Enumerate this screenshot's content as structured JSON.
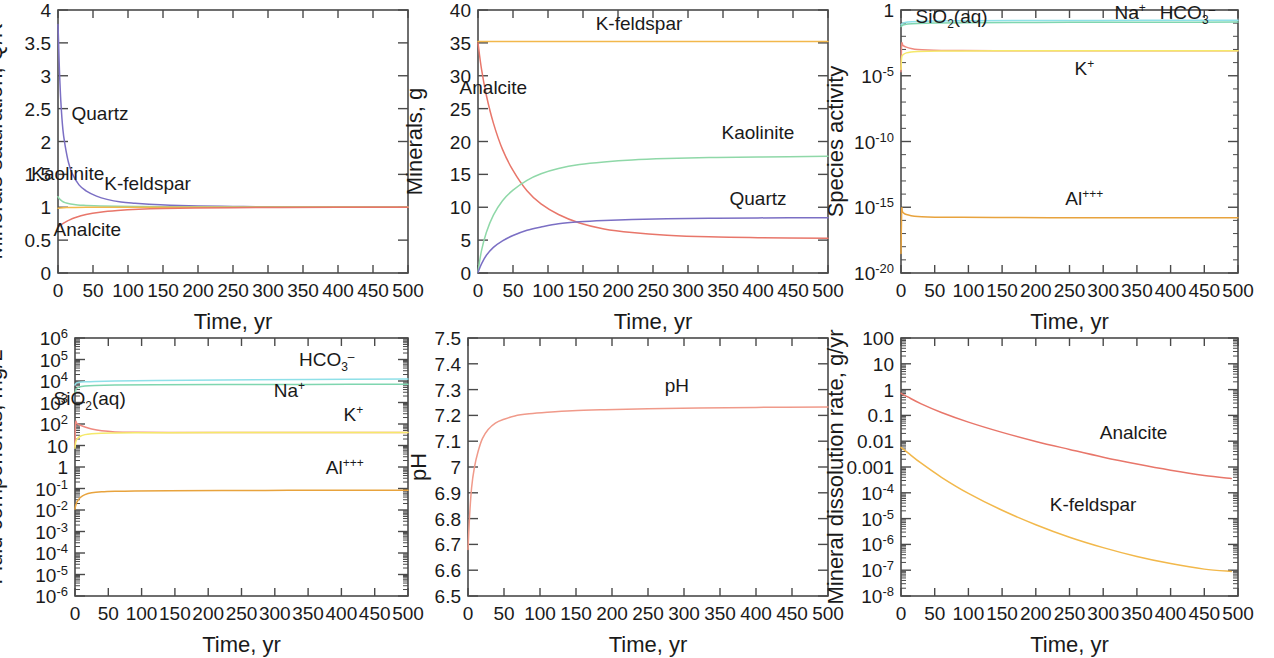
{
  "figure": {
    "title": "",
    "panel_count": 6,
    "layout": "2 rows x 3 columns",
    "colors": {
      "quartz": "#7b6fc4",
      "kaolinite": "#8fd8a8",
      "k_feldspar": "#f2b84b",
      "analcite": "#e8766a",
      "ph": "#f09a8a",
      "na": "#7fd6b0",
      "hco3": "#8fe0e8",
      "k_ion": "#f5e96a",
      "al": "#e8a33d",
      "sio2": "#ef8a80",
      "axis": "#4a4a4a",
      "text": "#1a1a1a"
    },
    "shared_xlabel": "Time, yr",
    "shared_xticks": [
      "0",
      "50",
      "100",
      "150",
      "200",
      "250",
      "300",
      "350",
      "400",
      "450",
      "500"
    ]
  },
  "chart_data": [
    {
      "id": "panel-minerals-saturation",
      "type": "line",
      "title": "",
      "xlabel": "Time, yr",
      "ylabel": "Minerals saturation, Q/K",
      "xlim": [
        0,
        500
      ],
      "ylim": [
        0,
        4
      ],
      "yscale": "linear",
      "xscale": "linear",
      "xticks": [
        "0",
        "50",
        "100",
        "150",
        "200",
        "250",
        "300",
        "350",
        "400",
        "450",
        "500"
      ],
      "yticks": [
        "0",
        "0.5",
        "1",
        "1.5",
        "2",
        "2.5",
        "3",
        "3.5",
        "4"
      ],
      "grid": false,
      "legend": "inline-annotations",
      "series": [
        {
          "name": "Quartz",
          "color": "#7b6fc4",
          "label_x": 60,
          "label_y": 2.32,
          "x": [
            0,
            1,
            2,
            4,
            7,
            10,
            15,
            20,
            30,
            40,
            55,
            70,
            90,
            110,
            130,
            160,
            200,
            250,
            300,
            400,
            500
          ],
          "values": [
            3.78,
            3.45,
            3.1,
            2.62,
            2.18,
            1.95,
            1.68,
            1.52,
            1.34,
            1.25,
            1.17,
            1.12,
            1.08,
            1.06,
            1.045,
            1.03,
            1.02,
            1.012,
            1.008,
            1.004,
            1.002
          ]
        },
        {
          "name": "Kaolinite",
          "color": "#8fd8a8",
          "label_x": 14,
          "label_y": 1.42,
          "x": [
            0,
            2,
            5,
            10,
            18,
            28,
            40,
            60,
            85,
            115,
            150,
            200,
            260,
            330,
            420,
            500
          ],
          "values": [
            1.16,
            1.13,
            1.1,
            1.07,
            1.05,
            1.035,
            1.028,
            1.02,
            1.015,
            1.012,
            1.009,
            1.006,
            1.004,
            1.003,
            1.002,
            1.001
          ]
        },
        {
          "name": "K-feldspar",
          "color": "#f2b84b",
          "label_x": 128,
          "label_y": 1.26,
          "x": [
            0,
            3,
            8,
            15,
            25,
            40,
            60,
            90,
            130,
            180,
            250,
            330,
            420,
            500
          ],
          "values": [
            0.985,
            0.99,
            0.994,
            0.996,
            0.998,
            0.999,
            1.0,
            1.0,
            1.0,
            1.0,
            1.0,
            1.0,
            1.0,
            1.0
          ]
        },
        {
          "name": "Analcite",
          "color": "#e8766a",
          "label_x": 42,
          "label_y": 0.56,
          "x": [
            0,
            3,
            8,
            15,
            25,
            40,
            60,
            85,
            115,
            150,
            195,
            250,
            320,
            400,
            500
          ],
          "values": [
            0.7,
            0.725,
            0.76,
            0.8,
            0.845,
            0.89,
            0.925,
            0.95,
            0.968,
            0.98,
            0.988,
            0.993,
            0.997,
            0.999,
            1.0
          ]
        }
      ]
    },
    {
      "id": "panel-minerals-mass",
      "type": "line",
      "title": "",
      "xlabel": "Time, yr",
      "ylabel": "Minerals, g",
      "xlim": [
        0,
        500
      ],
      "ylim": [
        0,
        40
      ],
      "yscale": "linear",
      "xscale": "linear",
      "xticks": [
        "0",
        "50",
        "100",
        "150",
        "200",
        "250",
        "300",
        "350",
        "400",
        "450",
        "500"
      ],
      "yticks": [
        "0",
        "5",
        "10",
        "15",
        "20",
        "25",
        "30",
        "35",
        "40"
      ],
      "grid": false,
      "legend": "inline-annotations",
      "series": [
        {
          "name": "K-feldspar",
          "color": "#f2b84b",
          "label_x": 230,
          "label_y": 37.0,
          "x": [
            0,
            50,
            100,
            200,
            300,
            400,
            500
          ],
          "values": [
            35.2,
            35.2,
            35.2,
            35.2,
            35.2,
            35.2,
            35.2
          ]
        },
        {
          "name": "Analcite",
          "color": "#e8766a",
          "label_x": 22,
          "label_y": 27.2,
          "x": [
            0,
            5,
            12,
            22,
            35,
            50,
            70,
            90,
            115,
            145,
            180,
            220,
            270,
            330,
            400,
            500
          ],
          "values": [
            35.0,
            31.0,
            27.0,
            22.8,
            18.8,
            15.6,
            12.5,
            10.5,
            8.9,
            7.6,
            6.7,
            6.15,
            5.75,
            5.5,
            5.38,
            5.3
          ]
        },
        {
          "name": "Kaolinite",
          "color": "#8fd8a8",
          "label_x": 400,
          "label_y": 20.4,
          "x": [
            0,
            5,
            12,
            22,
            35,
            50,
            70,
            90,
            115,
            145,
            180,
            220,
            270,
            330,
            400,
            500
          ],
          "values": [
            0.2,
            3.4,
            6.2,
            8.8,
            11.0,
            12.6,
            14.1,
            15.1,
            15.9,
            16.5,
            16.9,
            17.2,
            17.4,
            17.55,
            17.65,
            17.75
          ]
        },
        {
          "name": "Quartz",
          "color": "#7b6fc4",
          "label_x": 400,
          "label_y": 10.4,
          "x": [
            0,
            5,
            12,
            22,
            35,
            50,
            70,
            90,
            115,
            145,
            180,
            220,
            270,
            330,
            400,
            500
          ],
          "values": [
            0.1,
            1.4,
            2.7,
            3.9,
            4.9,
            5.7,
            6.5,
            7.0,
            7.5,
            7.8,
            8.0,
            8.15,
            8.25,
            8.32,
            8.38,
            8.42
          ]
        }
      ]
    },
    {
      "id": "panel-species-activity",
      "type": "line",
      "title": "",
      "xlabel": "Time, yr",
      "ylabel": "Species activity",
      "xlim": [
        0,
        500
      ],
      "ylim": [
        1e-20,
        1
      ],
      "yscale": "log",
      "xscale": "linear",
      "xticks": [
        "0",
        "50",
        "100",
        "150",
        "200",
        "250",
        "300",
        "350",
        "400",
        "450",
        "500"
      ],
      "yticks": [
        "10⁻²⁰",
        "10⁻¹⁵",
        "10⁻¹⁰",
        "10⁻⁵",
        "1"
      ],
      "ytick_exponents": [
        -20,
        -15,
        -10,
        -5,
        0
      ],
      "grid": false,
      "legend": "inline-annotations",
      "series": [
        {
          "name": "HCO3-",
          "color": "#8fe0e8",
          "label_x": 425,
          "label_y": 0.19,
          "x": [
            0,
            3,
            10,
            25,
            50,
            100,
            200,
            300,
            400,
            500
          ],
          "values": [
            0.075,
            0.1,
            0.12,
            0.135,
            0.145,
            0.152,
            0.158,
            0.162,
            0.165,
            0.168
          ]
        },
        {
          "name": "Na+",
          "color": "#7fd6b0",
          "label_x": 340,
          "label_y": 0.19,
          "x": [
            0,
            3,
            10,
            25,
            50,
            100,
            200,
            300,
            400,
            500
          ],
          "values": [
            0.055,
            0.072,
            0.085,
            0.095,
            0.102,
            0.108,
            0.113,
            0.116,
            0.118,
            0.12
          ]
        },
        {
          "name": "SiO2(aq)",
          "color": "#ef8a80",
          "label_x": 75,
          "label_y": 0.1,
          "x": [
            0,
            1,
            3,
            8,
            15,
            25,
            40,
            60,
            90,
            140,
            220,
            320,
            420,
            500
          ],
          "values": [
            2e-05,
            0.0025,
            0.002,
            0.0015,
            0.0012,
            0.001,
            0.0009,
            0.00085,
            0.00082,
            0.0008,
            0.0008,
            0.0008,
            0.0008,
            0.0008
          ]
        },
        {
          "name": "K+",
          "color": "#f5e96a",
          "label_x": 272,
          "label_y": 1.2e-05,
          "x": [
            0,
            1,
            3,
            8,
            15,
            25,
            40,
            60,
            90,
            140,
            220,
            320,
            420,
            500
          ],
          "values": [
            3e-05,
            0.00025,
            0.0004,
            0.00055,
            0.00065,
            0.0007,
            0.00073,
            0.00075,
            0.00077,
            0.00078,
            0.00079,
            0.0008,
            0.0008,
            0.0008
          ]
        },
        {
          "name": "Al+++",
          "color": "#e8a33d",
          "label_x": 272,
          "label_y": 1.6e-15,
          "x": [
            0,
            1,
            2,
            4,
            8,
            15,
            25,
            40,
            60,
            90,
            140,
            220,
            320,
            420,
            500
          ],
          "values": [
            3e-19,
            5.5e-16,
            4.8e-16,
            3.6e-16,
            2.8e-16,
            2.3e-16,
            2e-16,
            1.85e-16,
            1.75e-16,
            1.7e-16,
            1.65e-16,
            1.62e-16,
            1.6e-16,
            1.58e-16,
            1.57e-16
          ]
        }
      ]
    },
    {
      "id": "panel-fluid-components",
      "type": "line",
      "title": "",
      "xlabel": "Time, yr",
      "ylabel": "Fluid components, mg/L",
      "xlim": [
        0,
        500
      ],
      "ylim": [
        1e-06,
        1000000.0
      ],
      "yscale": "log",
      "xscale": "linear",
      "xticks": [
        "0",
        "50",
        "100",
        "150",
        "200",
        "250",
        "300",
        "350",
        "400",
        "450",
        "500"
      ],
      "yticks": [
        "10⁻⁶",
        "10⁻⁵",
        "10⁻⁴",
        "10⁻³",
        "10⁻²",
        "10⁻¹",
        "1",
        "10",
        "10²",
        "10³",
        "10⁴",
        "10⁵",
        "10⁶"
      ],
      "ytick_exponents": [
        -6,
        -5,
        -4,
        -3,
        -2,
        -1,
        0,
        1,
        2,
        3,
        4,
        5,
        6
      ],
      "grid": false,
      "legend": "inline-annotations",
      "series": [
        {
          "name": "HCO3-",
          "color": "#8fe0e8",
          "label_x": 378,
          "label_y": 52000,
          "x": [
            0,
            2,
            6,
            15,
            30,
            60,
            120,
            220,
            350,
            500
          ],
          "values": [
            6500,
            8000,
            8700,
            9200,
            9600,
            10000,
            10600,
            11200,
            11800,
            12400
          ]
        },
        {
          "name": "Na+",
          "color": "#7fd6b0",
          "label_x": 322,
          "label_y": 1750,
          "x": [
            0,
            2,
            6,
            15,
            30,
            60,
            120,
            220,
            350,
            500
          ],
          "values": [
            2800,
            4300,
            5200,
            5800,
            6200,
            6500,
            6700,
            6850,
            6950,
            7050
          ]
        },
        {
          "name": "SiO2(aq)",
          "color": "#ef8a80",
          "label_x": 22,
          "label_y": 760,
          "x": [
            0,
            1,
            3,
            8,
            15,
            25,
            40,
            60,
            90,
            140,
            220,
            320,
            420,
            500
          ],
          "values": [
            9.0,
            115,
            105,
            88,
            72,
            58,
            48,
            43,
            41,
            40,
            40,
            40,
            40,
            40
          ]
        },
        {
          "name": "K+",
          "color": "#f5e96a",
          "label_x": 418,
          "label_y": 145,
          "x": [
            0,
            1,
            3,
            8,
            15,
            25,
            40,
            60,
            90,
            140,
            220,
            320,
            420,
            500
          ],
          "values": [
            7.5,
            14,
            20,
            27,
            32,
            35,
            37,
            38,
            39,
            39.5,
            40,
            40,
            40,
            40
          ]
        },
        {
          "name": "Al+++",
          "color": "#e8a33d",
          "label_x": 405,
          "label_y": 0.45,
          "x": [
            0,
            1,
            3,
            8,
            15,
            25,
            40,
            60,
            90,
            140,
            220,
            320,
            420,
            500
          ],
          "values": [
            0.011,
            0.016,
            0.024,
            0.038,
            0.052,
            0.063,
            0.07,
            0.074,
            0.077,
            0.079,
            0.081,
            0.082,
            0.083,
            0.084
          ]
        }
      ]
    },
    {
      "id": "panel-ph",
      "type": "line",
      "title": "",
      "xlabel": "Time, yr",
      "ylabel": "pH",
      "xlim": [
        0,
        500
      ],
      "ylim": [
        6.5,
        7.5
      ],
      "yscale": "linear",
      "xscale": "linear",
      "xticks": [
        "0",
        "50",
        "100",
        "150",
        "200",
        "250",
        "300",
        "350",
        "400",
        "450",
        "500"
      ],
      "yticks": [
        "6.5",
        "6.6",
        "6.7",
        "6.8",
        "6.9",
        "7",
        "7.1",
        "7.2",
        "7.3",
        "7.4",
        "7.5"
      ],
      "grid": false,
      "legend": "inline-annotations",
      "series": [
        {
          "name": "pH",
          "color": "#f09a8a",
          "label_x": 290,
          "label_y": 7.29,
          "x": [
            0,
            2,
            5,
            9,
            14,
            20,
            28,
            38,
            50,
            65,
            85,
            110,
            145,
            190,
            250,
            320,
            400,
            500
          ],
          "values": [
            6.68,
            6.8,
            6.92,
            7.0,
            7.06,
            7.11,
            7.145,
            7.17,
            7.185,
            7.198,
            7.206,
            7.212,
            7.218,
            7.222,
            7.226,
            7.229,
            7.231,
            7.233
          ]
        }
      ]
    },
    {
      "id": "panel-dissolution-rate",
      "type": "line",
      "title": "",
      "xlabel": "Time, yr",
      "ylabel": "Mineral dissolution rate, g/yr",
      "xlim": [
        0,
        500
      ],
      "ylim": [
        1e-08,
        100
      ],
      "yscale": "log",
      "xscale": "linear",
      "xticks": [
        "0",
        "50",
        "100",
        "150",
        "200",
        "250",
        "300",
        "350",
        "400",
        "450",
        "500"
      ],
      "yticks": [
        "10⁻⁸",
        "10⁻⁷",
        "10⁻⁶",
        "10⁻⁵",
        "10⁻⁴",
        "0.001",
        "0.01",
        "0.1",
        "1",
        "10",
        "100"
      ],
      "ytick_exponents": [
        -8,
        -7,
        -6,
        -5,
        -4,
        -3,
        -2,
        -1,
        0,
        1,
        2
      ],
      "grid": false,
      "legend": "inline-annotations",
      "series": [
        {
          "name": "Analcite",
          "color": "#e8766a",
          "label_x": 345,
          "label_y": 0.012,
          "x": [
            0,
            10,
            30,
            60,
            100,
            150,
            200,
            250,
            300,
            350,
            400,
            450,
            490
          ],
          "values": [
            0.72,
            0.52,
            0.28,
            0.13,
            0.055,
            0.022,
            0.0098,
            0.0048,
            0.0024,
            0.0013,
            0.00075,
            0.00047,
            0.00036
          ]
        },
        {
          "name": "K-feldspar",
          "color": "#f2b84b",
          "label_x": 285,
          "label_y": 2e-05,
          "x": [
            0,
            10,
            30,
            60,
            100,
            150,
            200,
            250,
            300,
            350,
            400,
            450,
            490
          ],
          "values": [
            0.0058,
            0.0036,
            0.0014,
            0.0004,
            9.5e-05,
            2.1e-05,
            5.8e-06,
            1.9e-06,
            7.5e-07,
            3.4e-07,
            1.8e-07,
            1.1e-07,
            9e-08
          ]
        }
      ]
    }
  ]
}
